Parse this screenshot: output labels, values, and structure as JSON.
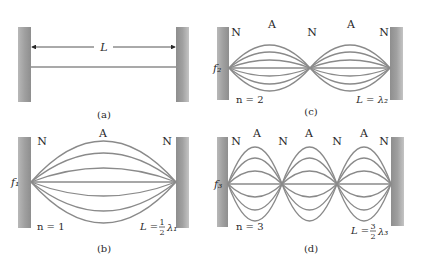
{
  "panels": {
    "a": {
      "caption": "(a)",
      "length_label": "L"
    },
    "b": {
      "caption": "(b)",
      "harmonic_label": "f₁",
      "mode_label": "n = 1",
      "length_relation": "L = ½ λ₁",
      "length_relation_lhs": "L =",
      "fraction_num": "1",
      "fraction_den": "2",
      "lambda": "λ₁",
      "nodes": [
        "N",
        "N"
      ],
      "antinodes": [
        "A"
      ],
      "segments": 1
    },
    "c": {
      "caption": "(c)",
      "harmonic_label": "f₂",
      "mode_label": "n = 2",
      "length_relation": "L = λ₂",
      "nodes": [
        "N",
        "N",
        "N"
      ],
      "antinodes": [
        "A",
        "A"
      ],
      "segments": 2
    },
    "d": {
      "caption": "(d)",
      "harmonic_label": "f₃",
      "mode_label": "n = 3",
      "length_relation": "L = 3/2 λ₃",
      "length_relation_lhs": "L =",
      "fraction_num": "3",
      "fraction_den": "2",
      "lambda": "λ₃",
      "nodes": [
        "N",
        "N",
        "N",
        "N"
      ],
      "antinodes": [
        "A",
        "A",
        "A"
      ],
      "segments": 3
    }
  },
  "colors": {
    "wall": "#9a9a9a",
    "string": "#8a8a8a",
    "text": "#2a2a2a"
  }
}
